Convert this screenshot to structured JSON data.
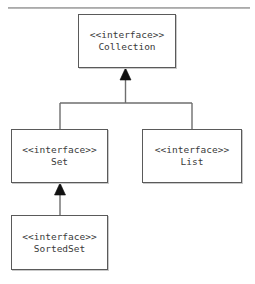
{
  "diagram": {
    "type": "uml-class-diagram",
    "stereotype_label": "<<interface>>",
    "classes": [
      {
        "id": "collection",
        "name": "Collection",
        "stereotype": "<<interface>>"
      },
      {
        "id": "set",
        "name": "Set",
        "stereotype": "<<interface>>"
      },
      {
        "id": "list",
        "name": "List",
        "stereotype": "<<interface>>"
      },
      {
        "id": "sortedset",
        "name": "SortedSet",
        "stereotype": "<<interface>>"
      }
    ],
    "relationships": [
      {
        "type": "generalization",
        "from": "Set",
        "to": "Collection",
        "arrow": "hollow-triangle-filled"
      },
      {
        "type": "generalization",
        "from": "List",
        "to": "Collection",
        "arrow": "hollow-triangle-filled"
      },
      {
        "type": "generalization",
        "from": "SortedSet",
        "to": "Set",
        "arrow": "hollow-triangle-filled"
      }
    ],
    "colors": {
      "box_border": "#5a5a5a",
      "box_fill": "#ffffff",
      "text": "#3a3a3a",
      "connector": "#6e6e6e",
      "rule": "#9b9b9b",
      "arrowhead": "#111111"
    }
  }
}
